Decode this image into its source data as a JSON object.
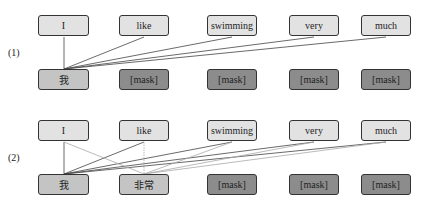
{
  "panels": [
    {
      "label": "(1)",
      "source_tokens": [
        "I",
        "like",
        "swimming",
        "very",
        "much"
      ],
      "target_tokens": [
        "我",
        "[mask]",
        "[mask]",
        "[mask]",
        "[mask]"
      ]
    },
    {
      "label": "(2)",
      "source_tokens": [
        "I",
        "like",
        "swimming",
        "very",
        "much"
      ],
      "target_tokens": [
        "我",
        "非常",
        "[mask]",
        "[mask]",
        "[mask]"
      ]
    }
  ],
  "colors": {
    "source_box": "#e2e2e2",
    "predicted_box": "#c4c4c4",
    "mask_box": "#8c8c8c",
    "line_dark": "#444444",
    "line_light": "#aaaaaa"
  }
}
